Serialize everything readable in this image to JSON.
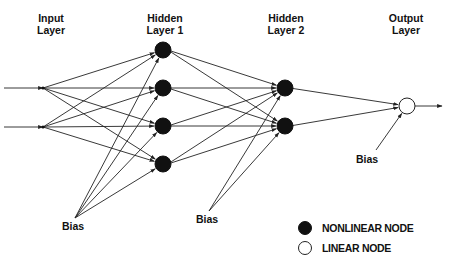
{
  "layers": [
    {
      "id": "input",
      "title_line1": "Input",
      "title_line2": "Layer",
      "x": 43,
      "nodes_y": [
        88,
        127
      ],
      "node_type": "input"
    },
    {
      "id": "hidden1",
      "title_line1": "Hidden",
      "title_line2": "Layer 1",
      "x": 163,
      "nodes_y": [
        50,
        88,
        126,
        164
      ],
      "node_type": "nonlinear"
    },
    {
      "id": "hidden2",
      "title_line1": "Hidden",
      "title_line2": "Layer 2",
      "x": 285,
      "nodes_y": [
        88,
        126
      ],
      "node_type": "nonlinear"
    },
    {
      "id": "output",
      "title_line1": "Output",
      "title_line2": "Layer",
      "x": 407,
      "nodes_y": [
        106
      ],
      "node_type": "linear"
    }
  ],
  "bias": [
    {
      "label": "Bias",
      "apex": [
        75,
        218
      ],
      "label_pos": [
        50,
        230
      ],
      "targets": "hidden1"
    },
    {
      "label": "Bias",
      "apex": [
        209,
        211
      ],
      "label_pos": [
        196,
        223
      ],
      "targets": "hidden2"
    },
    {
      "label": "Bias",
      "apex": [
        376,
        150
      ],
      "label_pos": [
        356,
        163
      ],
      "targets": "output"
    }
  ],
  "legend": {
    "items": [
      {
        "label": "NONLINEAR NODE",
        "type": "nonlinear"
      },
      {
        "label": "LINEAR NODE",
        "type": "linear"
      }
    ]
  },
  "colors": {
    "ink": "#111111",
    "node_fill": "#111111",
    "background": "#ffffff"
  }
}
